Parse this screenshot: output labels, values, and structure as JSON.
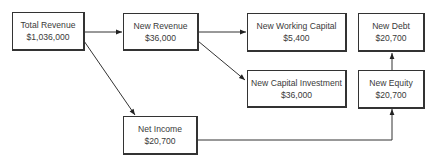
{
  "diagram": {
    "nodes": [
      {
        "id": "total-revenue",
        "label": "Total Revenue",
        "value": "$1,036,000"
      },
      {
        "id": "new-revenue",
        "label": "New Revenue",
        "value": "$36,000"
      },
      {
        "id": "new-working-capital",
        "label": "New Working Capital",
        "value": "$5,400"
      },
      {
        "id": "new-capital-investment",
        "label": "New Capital Investment",
        "value": "$36,000"
      },
      {
        "id": "new-debt",
        "label": "New Debt",
        "value": "$20,700"
      },
      {
        "id": "new-equity",
        "label": "New Equity",
        "value": "$20,700"
      },
      {
        "id": "net-income",
        "label": "Net Income",
        "value": "$20,700"
      }
    ],
    "edges": [
      {
        "from": "total-revenue",
        "to": "new-revenue"
      },
      {
        "from": "total-revenue",
        "to": "net-income"
      },
      {
        "from": "new-revenue",
        "to": "new-working-capital"
      },
      {
        "from": "new-revenue",
        "to": "new-capital-investment"
      },
      {
        "from": "net-income",
        "to": "new-equity"
      },
      {
        "from": "new-equity",
        "to": "new-debt"
      }
    ],
    "colors": {
      "line": "#333333",
      "text": "#3a3a3a",
      "background": "#ffffff"
    }
  }
}
